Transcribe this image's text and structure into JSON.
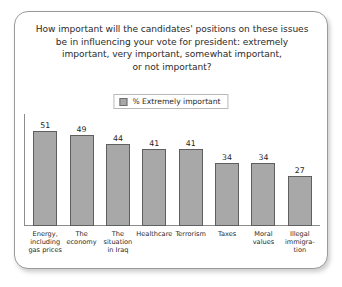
{
  "panel": {
    "title_lines": [
      "How important will the candidates' positions on these issues",
      "be in influencing your vote for president: extremely",
      "important, very important, somewhat important,",
      "or not important?"
    ]
  },
  "legend": {
    "swatch_name": "legend-color-swatch",
    "label": "% Extremely important",
    "color": "#a8a8a8"
  },
  "chart_data": {
    "type": "bar",
    "title": "How important will the candidates' positions on these issues be in influencing your vote for president: extremely important, very important, somewhat important, or not important?",
    "xlabel": "",
    "ylabel": "",
    "ylim": [
      0,
      60
    ],
    "grid": false,
    "legend_position": "top-center",
    "categories": [
      "Energy, including gas prices",
      "The economy",
      "The situation in Iraq",
      "Healthcare",
      "Terrorism",
      "Taxes",
      "Moral values",
      "Illegal immigration"
    ],
    "category_label_lines": [
      [
        "Energy,",
        "including",
        "gas prices"
      ],
      [
        "The",
        "economy"
      ],
      [
        "The",
        "situation",
        "in Iraq"
      ],
      [
        "Healthcare"
      ],
      [
        "Terrorism"
      ],
      [
        "Taxes"
      ],
      [
        "Moral",
        "values"
      ],
      [
        "Illegal",
        "immigra-",
        "tion"
      ]
    ],
    "series": [
      {
        "name": "% Extremely important",
        "color": "#a8a8a8",
        "values": [
          51,
          49,
          44,
          41,
          41,
          34,
          34,
          27
        ]
      }
    ]
  }
}
